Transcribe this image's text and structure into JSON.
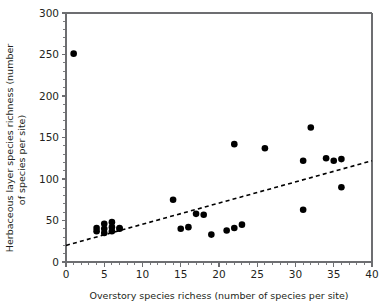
{
  "chart_data": {
    "type": "scatter",
    "title": "",
    "xlabel": "Overstory species richess  (number of species per site)",
    "ylabel_line1": "Herbaceous layer species richness (number",
    "ylabel_line2": "of species per site)",
    "xlim": [
      0,
      40
    ],
    "ylim": [
      0,
      300
    ],
    "x_major_ticks": [
      0,
      5,
      10,
      15,
      20,
      25,
      30,
      35,
      40
    ],
    "x_major_tick_labels": [
      "0",
      "5",
      "10",
      "15",
      "20",
      "25",
      "30",
      "35",
      "40"
    ],
    "x_minor_tick_step": 1,
    "y_major_ticks": [
      0,
      50,
      100,
      150,
      200,
      250,
      300
    ],
    "y_major_tick_labels": [
      "0",
      "50",
      "100",
      "150",
      "200",
      "250",
      "300"
    ],
    "y_minor_tick_step": 10,
    "grid": false,
    "legend": null,
    "marker_color": "#000000",
    "marker_size_px": 3.3,
    "points": [
      {
        "x": 1,
        "y": 251
      },
      {
        "x": 4,
        "y": 41
      },
      {
        "x": 4,
        "y": 37
      },
      {
        "x": 5,
        "y": 46
      },
      {
        "x": 5,
        "y": 40
      },
      {
        "x": 5,
        "y": 35
      },
      {
        "x": 6,
        "y": 48
      },
      {
        "x": 6,
        "y": 42
      },
      {
        "x": 6,
        "y": 37
      },
      {
        "x": 7,
        "y": 41
      },
      {
        "x": 7,
        "y": 40
      },
      {
        "x": 14,
        "y": 75
      },
      {
        "x": 15,
        "y": 40
      },
      {
        "x": 16,
        "y": 42
      },
      {
        "x": 17,
        "y": 58
      },
      {
        "x": 18,
        "y": 57
      },
      {
        "x": 19,
        "y": 33
      },
      {
        "x": 21,
        "y": 38
      },
      {
        "x": 22,
        "y": 41
      },
      {
        "x": 22,
        "y": 142
      },
      {
        "x": 23,
        "y": 45
      },
      {
        "x": 26,
        "y": 137
      },
      {
        "x": 31,
        "y": 63
      },
      {
        "x": 31,
        "y": 122
      },
      {
        "x": 32,
        "y": 162
      },
      {
        "x": 34,
        "y": 125
      },
      {
        "x": 35,
        "y": 122
      },
      {
        "x": 36,
        "y": 90
      },
      {
        "x": 36,
        "y": 124
      }
    ],
    "trend_line": {
      "style": "dashed",
      "color": "#000000",
      "x_start": 0,
      "y_start": 20,
      "x_end": 40,
      "y_end": 122
    }
  }
}
